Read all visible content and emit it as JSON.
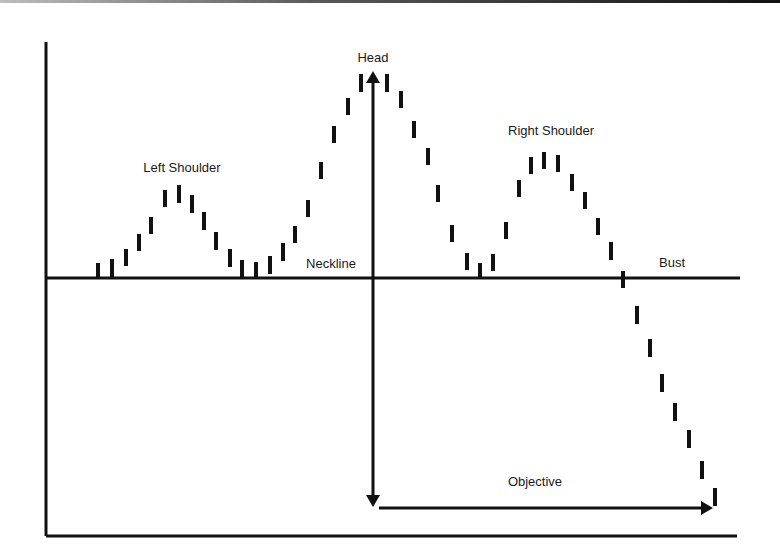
{
  "chart_data": {
    "type": "bar",
    "subtype": "price-bars (head-and-shoulders pattern illustration)",
    "title": "",
    "xlabel": "",
    "ylabel": "",
    "grid": false,
    "legend": null,
    "axes": {
      "left_axis": {
        "x": 46,
        "y1": 42,
        "y2": 536
      },
      "bottom_axis": {
        "y": 536,
        "x1": 46,
        "x2": 737
      }
    },
    "neckline": {
      "y": 278,
      "x1": 46,
      "x2": 740,
      "label": "Neckline"
    },
    "annotations": [
      {
        "name": "left-shoulder-label",
        "text": "Left Shoulder",
        "x": 182,
        "y": 172
      },
      {
        "name": "head-label",
        "text": "Head",
        "x": 373,
        "y": 62
      },
      {
        "name": "right-shoulder-label",
        "text": "Right Shoulder",
        "x": 551,
        "y": 135
      },
      {
        "name": "neckline-label",
        "text": "Neckline",
        "x": 331,
        "y": 268
      },
      {
        "name": "bust-label",
        "text": "Bust",
        "x": 672,
        "y": 267
      },
      {
        "name": "objective-label",
        "text": "Objective",
        "x": 535,
        "y": 486
      }
    ],
    "arrows": {
      "vertical": {
        "x": 373,
        "y_top": 71,
        "y_bottom": 507,
        "heads": "both"
      },
      "horizontal": {
        "y": 508,
        "x_start": 379,
        "x_end": 713,
        "heads": "end"
      }
    },
    "bar_width": 4,
    "bars": [
      {
        "x": 98,
        "top": 263,
        "bottom": 277
      },
      {
        "x": 112,
        "top": 259,
        "bottom": 277
      },
      {
        "x": 126,
        "top": 249,
        "bottom": 266
      },
      {
        "x": 139,
        "top": 234,
        "bottom": 251
      },
      {
        "x": 151,
        "top": 217,
        "bottom": 234
      },
      {
        "x": 165,
        "top": 190,
        "bottom": 207
      },
      {
        "x": 179,
        "top": 185,
        "bottom": 203
      },
      {
        "x": 192,
        "top": 195,
        "bottom": 213
      },
      {
        "x": 204,
        "top": 212,
        "bottom": 230
      },
      {
        "x": 216,
        "top": 232,
        "bottom": 250
      },
      {
        "x": 230,
        "top": 249,
        "bottom": 267
      },
      {
        "x": 242,
        "top": 260,
        "bottom": 277
      },
      {
        "x": 256,
        "top": 262,
        "bottom": 277
      },
      {
        "x": 270,
        "top": 256,
        "bottom": 274
      },
      {
        "x": 283,
        "top": 243,
        "bottom": 261
      },
      {
        "x": 295,
        "top": 226,
        "bottom": 243
      },
      {
        "x": 308,
        "top": 200,
        "bottom": 217
      },
      {
        "x": 321,
        "top": 162,
        "bottom": 179
      },
      {
        "x": 334,
        "top": 126,
        "bottom": 143
      },
      {
        "x": 348,
        "top": 98,
        "bottom": 115
      },
      {
        "x": 361,
        "top": 74,
        "bottom": 92
      },
      {
        "x": 387,
        "top": 74,
        "bottom": 92
      },
      {
        "x": 401,
        "top": 91,
        "bottom": 108
      },
      {
        "x": 414,
        "top": 121,
        "bottom": 138
      },
      {
        "x": 428,
        "top": 148,
        "bottom": 165
      },
      {
        "x": 438,
        "top": 185,
        "bottom": 202
      },
      {
        "x": 452,
        "top": 225,
        "bottom": 242
      },
      {
        "x": 467,
        "top": 253,
        "bottom": 270
      },
      {
        "x": 480,
        "top": 263,
        "bottom": 278
      },
      {
        "x": 493,
        "top": 254,
        "bottom": 271
      },
      {
        "x": 506,
        "top": 222,
        "bottom": 239
      },
      {
        "x": 519,
        "top": 180,
        "bottom": 197
      },
      {
        "x": 531,
        "top": 157,
        "bottom": 174
      },
      {
        "x": 544,
        "top": 152,
        "bottom": 169
      },
      {
        "x": 558,
        "top": 155,
        "bottom": 172
      },
      {
        "x": 572,
        "top": 174,
        "bottom": 191
      },
      {
        "x": 585,
        "top": 192,
        "bottom": 209
      },
      {
        "x": 598,
        "top": 218,
        "bottom": 235
      },
      {
        "x": 611,
        "top": 242,
        "bottom": 260
      },
      {
        "x": 623,
        "top": 271,
        "bottom": 288
      },
      {
        "x": 637,
        "top": 306,
        "bottom": 324
      },
      {
        "x": 650,
        "top": 339,
        "bottom": 357
      },
      {
        "x": 662,
        "top": 374,
        "bottom": 392
      },
      {
        "x": 675,
        "top": 403,
        "bottom": 421
      },
      {
        "x": 689,
        "top": 430,
        "bottom": 448
      },
      {
        "x": 702,
        "top": 461,
        "bottom": 479
      },
      {
        "x": 715,
        "top": 488,
        "bottom": 506
      }
    ],
    "colors": {
      "ink": "#111111",
      "background": "#ffffff"
    }
  },
  "labels": {
    "left_shoulder": "Left Shoulder",
    "head": "Head",
    "right_shoulder": "Right Shoulder",
    "neckline": "Neckline",
    "bust": "Bust",
    "objective": "Objective"
  }
}
